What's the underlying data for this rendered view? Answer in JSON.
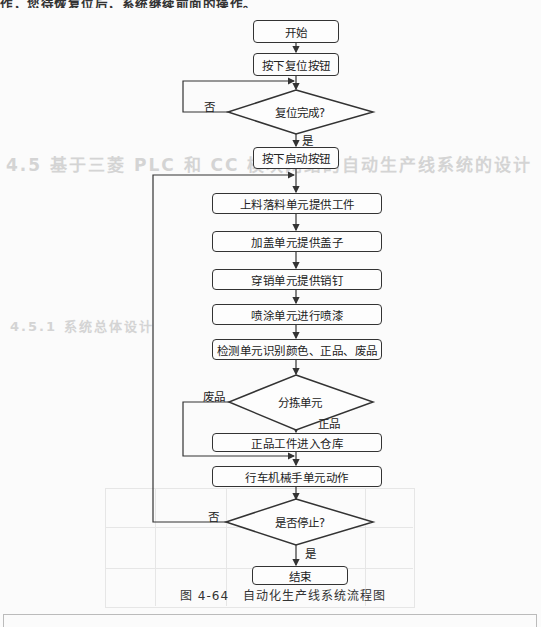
{
  "page": {
    "top_text": "作，您待恢复位后，系统继续前面的操作。",
    "ghost_heading": "4.5  基于三菱 PLC 和 CC 模块网络的自动生产线系统的设计",
    "ghost_subheading": "4.5.1  系统总体设计"
  },
  "flowchart": {
    "nodes": {
      "start": "开始",
      "reset_button": "按下复位按钮",
      "reset_done": "复位完成?",
      "start_button": "按下启动按钮",
      "feed_unit": "上料落料单元提供工件",
      "cap_unit": "加盖单元提供盖子",
      "pin_unit": "穿销单元提供销钉",
      "paint_unit": "喷涂单元进行喷漆",
      "inspect_unit": "检测单元识别颜色、正品、废品",
      "sort_unit": "分拣单元",
      "good_store": "正品工件进入仓库",
      "crane_unit": "行车机械手单元动作",
      "stop_check": "是否停止?",
      "end": "结束"
    },
    "edge_labels": {
      "reset_no": "否",
      "reset_yes": "是",
      "sort_reject": "废品",
      "sort_good": "正品",
      "stop_no": "否",
      "stop_yes": "是"
    }
  },
  "caption": {
    "figure_number": "图 4-64",
    "title": "自动化生产线系统流程图"
  },
  "colors": {
    "line": "#333333",
    "background": "#fbfbfb",
    "ghost_text": "#d8d8d8"
  }
}
